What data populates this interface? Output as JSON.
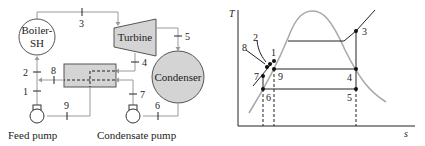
{
  "schematic": {
    "components": {
      "boiler": {
        "label_line1": "Boiler-",
        "label_line2": "SH"
      },
      "turbine": {
        "label": "Turbine"
      },
      "condenser": {
        "label": "Condenser"
      },
      "feed_pump": {
        "label": "Feed pump"
      },
      "condensate_pump": {
        "label": "Condensate pump"
      },
      "heater": {
        "label": ""
      }
    },
    "state_labels": {
      "s1": "1",
      "s2": "2",
      "s3": "3",
      "s4": "4",
      "s5": "5",
      "s6": "6",
      "s7": "7",
      "s8": "8",
      "s9": "9"
    },
    "colors": {
      "component_fill": "#d4d4d4",
      "pipe": "#9a9a9a",
      "stroke": "#222222"
    }
  },
  "ts_diagram": {
    "y_axis_label": "T",
    "x_axis_label": "s",
    "points": {
      "p1": "1",
      "p2": "2",
      "p3": "3",
      "p4": "4",
      "p5": "5",
      "p6": "6",
      "p7": "7",
      "p8": "8",
      "p9": "9"
    },
    "colors": {
      "saturation_dome": "#aaaaaa",
      "process_lines": "#222222"
    }
  }
}
